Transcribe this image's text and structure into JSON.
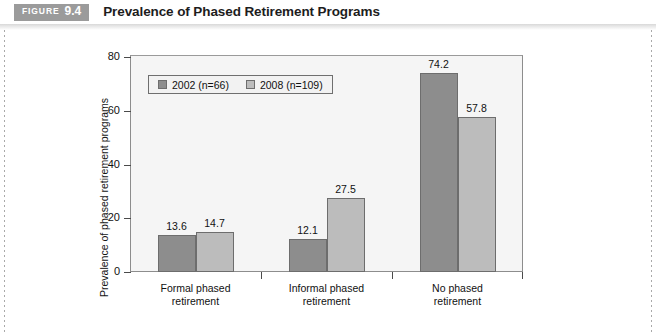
{
  "header": {
    "badge_word": "FIGURE",
    "badge_number": "9.4",
    "title": "Prevalence of Phased Retirement Programs"
  },
  "chart_data": {
    "type": "bar",
    "title": "Prevalence of Phased Retirement Programs",
    "xlabel": "",
    "ylabel": "Prevalence of phased retirement programs",
    "ylim": [
      0,
      80
    ],
    "yticks": [
      "0",
      "20",
      "40",
      "60",
      "80"
    ],
    "grid": false,
    "legend_position": "upper-left-inside",
    "categories": [
      "Formal phased\nretirement",
      "Informal phased\nretirement",
      "No phased\nretirement"
    ],
    "categories_lines": [
      [
        "Formal phased",
        "retirement"
      ],
      [
        "Informal phased",
        "retirement"
      ],
      [
        "No phased",
        "retirement"
      ]
    ],
    "series": [
      {
        "name": "2002 (n=66)",
        "color": "#8d8d8d",
        "values": [
          13.6,
          12.1,
          74.2
        ],
        "labels": [
          "13.6",
          "12.1",
          "74.2"
        ]
      },
      {
        "name": "2008 (n=109)",
        "color": "#bcbcbc",
        "values": [
          14.7,
          27.5,
          57.8
        ],
        "labels": [
          "14.7",
          "27.5",
          "57.8"
        ]
      }
    ]
  }
}
